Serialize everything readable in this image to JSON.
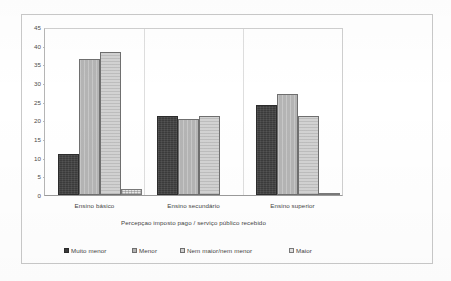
{
  "chart_data": {
    "type": "bar",
    "title": "",
    "xlabel": "Percepçao imposto pago / serviço público recebido",
    "ylabel": "",
    "ylim": [
      0,
      45
    ],
    "yticks": [
      0,
      5,
      10,
      15,
      20,
      25,
      30,
      35,
      40,
      45
    ],
    "grid": false,
    "legend_position": "bottom",
    "categories": [
      "Ensino básico",
      "Ensino secundário",
      "Ensino superior"
    ],
    "series": [
      {
        "name": "Muito menor",
        "color": "#3b3b3b",
        "values": [
          11.0,
          21.5,
          24.5
        ]
      },
      {
        "name": "Menor",
        "color": "#b4b4b4",
        "values": [
          36.8,
          20.6,
          27.4
        ]
      },
      {
        "name": "Nem maior/nem menor",
        "color": "#d2d2d2",
        "values": [
          38.8,
          21.4,
          21.3
        ]
      },
      {
        "name": "Maior",
        "color": "#e8e8e8",
        "values": [
          1.5,
          0.0,
          0.5
        ]
      }
    ]
  },
  "y_axis": {
    "labels": [
      "45",
      "40",
      "35",
      "30",
      "25",
      "20",
      "15",
      "10",
      "5",
      "0"
    ]
  },
  "x_axis": {
    "title": "Percepçao imposto pago / serviço público recebido",
    "categories": [
      {
        "label": "Ensino básico"
      },
      {
        "label": "Ensino secundário"
      },
      {
        "label": "Ensino superior"
      }
    ]
  },
  "legend": {
    "items": [
      {
        "label": "Muito menor"
      },
      {
        "label": "Menor"
      },
      {
        "label": "Nem maior/nem menor"
      },
      {
        "label": "Maior"
      }
    ]
  }
}
